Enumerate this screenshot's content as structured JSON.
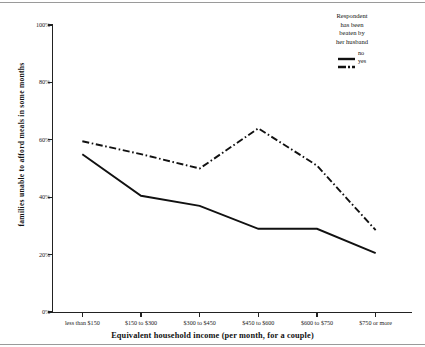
{
  "chart_data": {
    "type": "line",
    "title": "",
    "xlabel": "Equivalent household income (per month, for a couple)",
    "ylabel": "families unable to afford meals in some months",
    "categories": [
      "less than $150",
      "$150 to $300",
      "$300 to $450",
      "$450 to $600",
      "$600 to $750",
      "$750 or more"
    ],
    "series": [
      {
        "name": "no",
        "style": "solid",
        "values": [
          55,
          40.5,
          37,
          29,
          29,
          20.5
        ]
      },
      {
        "name": "yes",
        "style": "dash-dot",
        "values": [
          59.5,
          55,
          50,
          64,
          51,
          28.5
        ]
      }
    ],
    "ylim": [
      0,
      100
    ],
    "yticks": [
      "0%",
      "20%",
      "40%",
      "60%",
      "80%",
      "100%"
    ],
    "ytick_values": [
      0,
      20,
      40,
      60,
      80,
      100
    ],
    "grid": false,
    "legend_position": "top-right",
    "legend_title": "Respondent has been beaten by her husband",
    "legend_title_lines": [
      "Respondent",
      "has been",
      "beaten by",
      "her husband"
    ],
    "line_color": "#111111"
  }
}
